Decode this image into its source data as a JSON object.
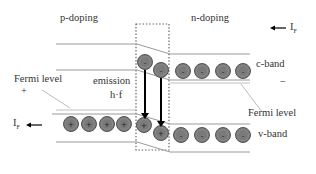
{
  "diagram": {
    "regions": {
      "left_label": "p-doping",
      "right_label": "n-doping"
    },
    "bands": {
      "conduction": "c-band",
      "valence": "v-band"
    },
    "fermi_left": {
      "label": "Fermi level",
      "sign": "+"
    },
    "fermi_right": {
      "label": "Fermi level",
      "sign": "−"
    },
    "emission": {
      "label": "emission",
      "energy": "h·f"
    },
    "current_right": {
      "symbol": "I",
      "subscript": "F"
    },
    "current_left": {
      "symbol": "I",
      "subscript": "F"
    },
    "carriers": {
      "electron_symbol": "-",
      "hole_symbol": "+",
      "electron_count": 7,
      "hole_count": 6
    },
    "colors": {
      "carrier_fill": "#7a7a7a",
      "carrier_stroke": "#555555",
      "band_line": "#9a9a9a",
      "arrow": "#000000",
      "junction_box": "#666666",
      "text": "#333333"
    }
  }
}
